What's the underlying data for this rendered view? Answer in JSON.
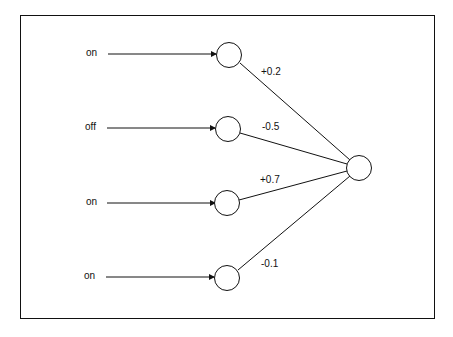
{
  "diagram": {
    "type": "perceptron",
    "inputs": [
      {
        "label": "on",
        "weight": "+0.2"
      },
      {
        "label": "off",
        "weight": "-0.5"
      },
      {
        "label": "on",
        "weight": "+0.7"
      },
      {
        "label": "on",
        "weight": "-0.1"
      }
    ],
    "colors": {
      "stroke": "#111111",
      "background": "#ffffff"
    }
  }
}
